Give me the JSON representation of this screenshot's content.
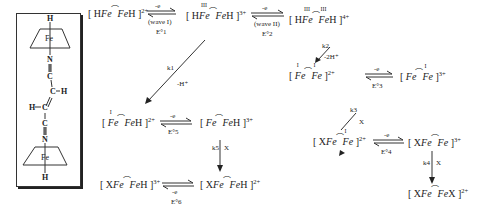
{
  "structure": {
    "atoms": {
      "h_top": "H",
      "fe_top": "Fe",
      "n_top": "N",
      "c1": "C",
      "c2": "C",
      "h_c2": "H",
      "h_c3": "H",
      "c3": "C",
      "c4": "C",
      "n_bottom": "N",
      "fe_bottom": "Fe",
      "h_bottom": "H"
    }
  },
  "species": {
    "s1": {
      "pre": "[ H",
      "fe1": "Fe",
      "fe2": "Fe",
      "post": "H ]",
      "charge": "2+",
      "ox1": "",
      "ox2": ""
    },
    "s2": {
      "pre": "[ H",
      "fe1": "Fe",
      "fe2": "Fe",
      "post": "H ]",
      "charge": "3+",
      "ox1": "III",
      "ox2": ""
    },
    "s3": {
      "pre": "[ H",
      "fe1": "Fe",
      "fe2": "Fe",
      "post": "H ]",
      "charge": "4+",
      "ox1": "III",
      "ox2": "III"
    },
    "s4": {
      "pre": "[ ",
      "fe1": "Fe",
      "fe2": "Fe",
      "post": " ]",
      "charge": "2+",
      "ox1": "I",
      "ox2": "I"
    },
    "s5": {
      "pre": "[ ",
      "fe1": "Fe",
      "fe2": "Fe",
      "post": " ]",
      "charge": "3+",
      "ox1": "",
      "ox2": "I"
    },
    "s6": {
      "pre": "[ ",
      "fe1": "Fe",
      "fe2": "Fe",
      "post": "H ]",
      "charge": "2+",
      "ox1": "I",
      "ox2": ""
    },
    "s7": {
      "pre": "[ ",
      "fe1": "Fe",
      "fe2": "Fe",
      "post": "H ]",
      "charge": "3+",
      "ox1": "",
      "ox2": ""
    },
    "s8": {
      "pre": "[ X",
      "fe1": "Fe",
      "fe2": "Fe",
      "post": " ]",
      "charge": "2+",
      "ox1": "",
      "ox2": "I"
    },
    "s9": {
      "pre": "[ X",
      "fe1": "Fe",
      "fe2": "Fe",
      "post": " ]",
      "charge": "3+",
      "ox1": "",
      "ox2": ""
    },
    "s10": {
      "pre": "[ X",
      "fe1": "Fe",
      "fe2": "Fe",
      "post": "X ]",
      "charge": "2+",
      "ox1": "",
      "ox2": ""
    },
    "s11": {
      "pre": "[ X",
      "fe1": "Fe",
      "fe2": "Fe",
      "post": "H ]",
      "charge": "3+",
      "ox1": "",
      "ox2": ""
    },
    "s12": {
      "pre": "[ X",
      "fe1": "Fe",
      "fe2": "Fe",
      "post": "H ]",
      "charge": "2+",
      "ox1": "",
      "ox2": ""
    }
  },
  "arrows": {
    "a1": {
      "top": "-e",
      "bottom": "(wave I)",
      "potential": "E°1"
    },
    "a2": {
      "top": "-e",
      "bottom": "(wave II)",
      "potential": "E°2"
    },
    "a3": {
      "top": "-e",
      "potential": "E°3"
    },
    "a4": {
      "top": "-e",
      "potential": "E°4"
    },
    "a5": {
      "top": "-e",
      "potential": "E°5"
    },
    "a6": {
      "bottom": "-e",
      "potential": "E°6"
    },
    "k1": {
      "rate": "k1",
      "loss": "-H⁺"
    },
    "k2": {
      "rate": "k2",
      "loss": "-2H⁺"
    },
    "k3": {
      "rate": "k3",
      "reagent": "X"
    },
    "k4": {
      "rate": "k4",
      "reagent": "X"
    },
    "k5": {
      "rate": "k5",
      "reagent": "X"
    }
  }
}
